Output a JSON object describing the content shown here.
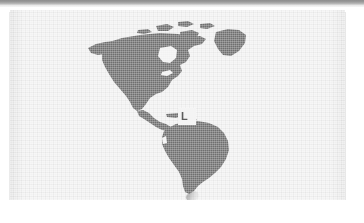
{
  "document": {
    "kind": "scanned-map-figure",
    "title": "Map of the Americas"
  },
  "top_band": {
    "name": "page-edge-band",
    "color_start": "#8d8d8d",
    "color_end": "#dedede"
  },
  "panel": {
    "background_color": "#f2f2f2",
    "texture": "scanner-grid"
  },
  "map": {
    "name": "americas-map",
    "projection": "western-hemisphere",
    "land_color": "#6f6f6f",
    "water_color": "#f2f2f2",
    "regions": [
      "North America",
      "Greenland",
      "Canadian Arctic Archipelago",
      "Central America",
      "Caribbean",
      "South America"
    ]
  },
  "marker": {
    "name": "location-marker",
    "box_color": "#f4f4f4",
    "glyph": "L",
    "glyph_color": "#5d5d5d",
    "region": "northern South America"
  },
  "artifacts": {
    "smudge_label": "scan smudge"
  }
}
